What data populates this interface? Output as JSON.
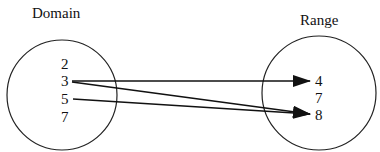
{
  "domain": {
    "label": "Domain",
    "elements": [
      "2",
      "3",
      "5",
      "7"
    ]
  },
  "range": {
    "label": "Range",
    "elements": [
      "4",
      "7",
      "8"
    ]
  },
  "mappings": [
    {
      "from": "3",
      "to": "4"
    },
    {
      "from": "3",
      "to": "8"
    },
    {
      "from": "5",
      "to": "8"
    }
  ]
}
